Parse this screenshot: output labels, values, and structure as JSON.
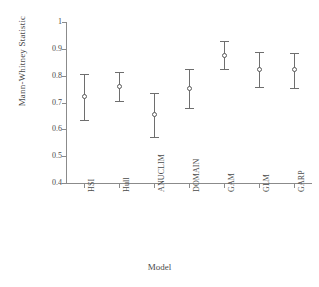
{
  "chart_data": {
    "type": "scatter",
    "title": "",
    "xlabel": "Model",
    "ylabel": "Mann-Whitney Statistic",
    "categories": [
      "HSI",
      "Hull",
      "ANUCLIM",
      "DOMAIN",
      "GAM",
      "GLM",
      "GARP"
    ],
    "values": [
      0.72,
      0.757,
      0.652,
      0.75,
      0.875,
      0.822,
      0.82
    ],
    "error_low": [
      0.635,
      0.705,
      0.572,
      0.68,
      0.825,
      0.758,
      0.753
    ],
    "error_high": [
      0.805,
      0.815,
      0.735,
      0.825,
      0.928,
      0.888,
      0.885
    ],
    "ylim": [
      0.4,
      1.0
    ],
    "yticks": [
      0.4,
      0.5,
      0.6,
      0.7,
      0.8,
      0.9,
      1.0
    ],
    "ytick_labels": [
      "0.4",
      "0.5",
      "0.6",
      "0.7",
      "0.8",
      "0.9",
      "1"
    ],
    "grid": false,
    "legend": "none",
    "marker": "open-circle",
    "errorbar_style": "capped-vertical",
    "xtick_label_rotation": -90,
    "colors": {
      "axis": "#8b8b8b",
      "errorbar": "#6e6e6e",
      "marker_edge": "#5a5a5a",
      "marker_fill": "#ffffff",
      "text": "#4a4a4a",
      "background": "#ffffff"
    }
  }
}
